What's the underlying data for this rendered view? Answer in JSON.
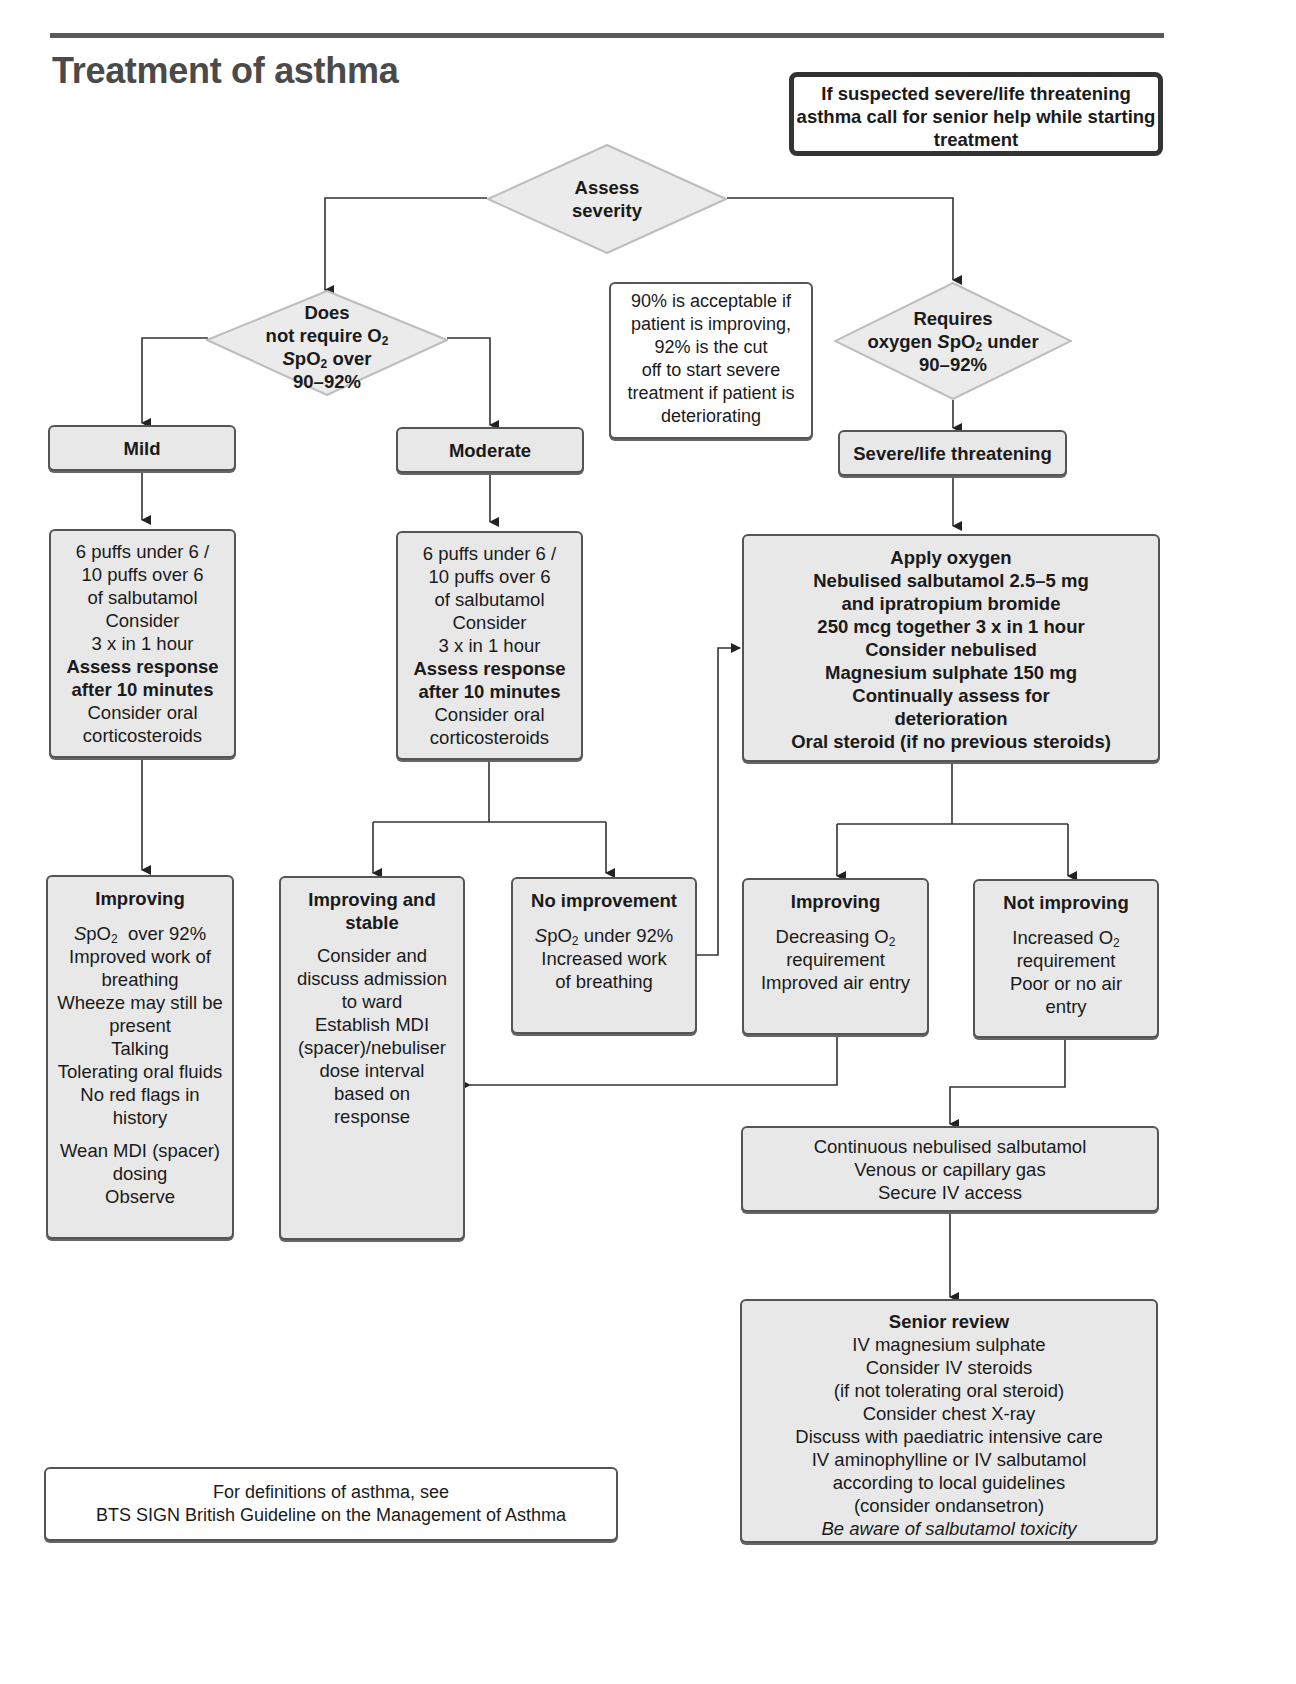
{
  "header": {
    "title": "Treatment of asthma",
    "warning": [
      "If suspected severe/life threatening",
      "asthma call for senior help while",
      "starting treatment"
    ]
  },
  "assess": {
    "lines": [
      "Assess",
      "severity"
    ]
  },
  "decision_left": {
    "line1": "Does",
    "line2": "not require O",
    "line2_sub": "2",
    "line3_pre": "S",
    "line3": "pO",
    "line3_sub": "2",
    "line3_post": " over",
    "line4": "90–92%"
  },
  "decision_right": {
    "line1": "Requires",
    "line2_pre": "oxygen ",
    "line2_s": "S",
    "line2": "pO",
    "line2_sub": "2",
    "line2_post": " under",
    "line3": "90–92%"
  },
  "note": {
    "lines": [
      "90% is acceptable if",
      "patient is improving,",
      "92% is the cut",
      "off to start severe",
      "treatment if patient is",
      "deteriorating"
    ]
  },
  "severity": {
    "mild": "Mild",
    "moderate": "Moderate",
    "severe": "Severe/life threatening"
  },
  "mild_treatment": {
    "lines": [
      "6 puffs under 6 /",
      "10 puffs over 6",
      "of salbutamol",
      "Consider",
      "3 x in 1 hour"
    ],
    "bold_lines": [
      "Assess response",
      "after 10 minutes"
    ],
    "tail_lines": [
      "Consider oral",
      "corticosteroids"
    ]
  },
  "moderate_treatment": {
    "lines": [
      "6 puffs under 6 /",
      "10 puffs over 6",
      "of salbutamol",
      "Consider",
      "3 x in 1 hour"
    ],
    "bold_lines": [
      "Assess response",
      "after 10 minutes"
    ],
    "tail_lines": [
      "Consider oral",
      "corticosteroids"
    ]
  },
  "severe_treatment": {
    "lines": [
      "Apply oxygen",
      "Nebulised salbutamol 2.5–5 mg",
      "and ipratropium bromide",
      "250 mcg together 3 x in 1 hour",
      "Consider nebulised",
      "Magnesium sulphate 150 mg",
      "Continually assess for",
      "deterioration",
      "Oral steroid (if no previous steroids)"
    ]
  },
  "mild_improving": {
    "title": "Improving",
    "spo2_pre": "S",
    "spo2": "pO",
    "spo2_sub": "2",
    "spo2_post": "  over 92%",
    "lines": [
      "Improved work of",
      "breathing",
      "Wheeze may still be",
      "present",
      "Talking",
      "Tolerating oral fluids",
      "No red flags in",
      "history"
    ],
    "tail_lines": [
      "Wean MDI (spacer)",
      "dosing",
      "Observe"
    ]
  },
  "mod_improving": {
    "title": [
      "Improving and",
      "stable"
    ],
    "lines": [
      "Consider and",
      "discuss admission",
      "to ward",
      "Establish MDI",
      "(spacer)/nebuliser",
      "dose interval",
      "based on",
      "response"
    ]
  },
  "mod_no_improvement": {
    "title": "No improvement",
    "spo2_pre": "S",
    "spo2": "pO",
    "spo2_sub": "2",
    "spo2_post": " under 92%",
    "lines": [
      "Increased work",
      "of breathing"
    ]
  },
  "sev_improving": {
    "title": "Improving",
    "line1": "Decreasing O",
    "line1_sub": "2",
    "lines": [
      "requirement",
      "Improved air entry"
    ]
  },
  "sev_not_improving": {
    "title": "Not improving",
    "line1": "Increased O",
    "line1_sub": "2",
    "lines": [
      "requirement",
      "Poor or no air",
      "entry"
    ]
  },
  "continuous": {
    "lines": [
      "Continuous nebulised salbutamol",
      "Venous or capillary gas",
      "Secure IV access"
    ]
  },
  "senior_review": {
    "title": "Senior review",
    "lines": [
      "IV magnesium sulphate",
      "Consider IV steroids",
      "(if not tolerating oral steroid)",
      "Consider chest X-ray",
      "Discuss with paediatric intensive care",
      "IV aminophylline or IV salbutamol",
      "according to local guidelines",
      "(consider ondansetron)"
    ],
    "italic_line": "Be aware of salbutamol toxicity"
  },
  "footer": {
    "lines": [
      "For definitions of asthma, see",
      "BTS SIGN British Guideline on the Management of Asthma"
    ]
  },
  "colors": {
    "box_fill": "#e8e8e8",
    "border": "#555555",
    "diamond_fill": "#ebebeb",
    "diamond_stroke": "#bdbdbd",
    "title": "#4a4a4a"
  }
}
